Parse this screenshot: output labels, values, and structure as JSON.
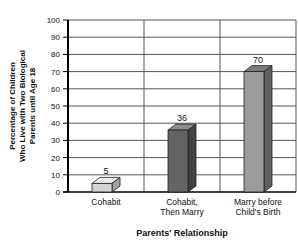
{
  "chart_data": {
    "type": "bar",
    "title": "",
    "categories": [
      "Cohabit",
      "Cohabit, Then Marry",
      "Marry before Child's Birth"
    ],
    "category_lines": [
      [
        "Cohabit"
      ],
      [
        "Cohabit,",
        "Then Marry"
      ],
      [
        "Marry before",
        "Child's Birth"
      ]
    ],
    "values": [
      5,
      36,
      70
    ],
    "value_labels": [
      "5",
      "36",
      "70"
    ],
    "xlabel": "Parents' Relationship",
    "ylabel": "Percentage of Children Who Live with Two Biological Parents until Age 18",
    "ylabel_lines": [
      "Percentage of Children",
      "Who Live with Two Biological",
      "Parents until Age 18"
    ],
    "ylim": [
      0,
      100
    ],
    "ytick_step": 10,
    "yticks": [
      0,
      10,
      20,
      30,
      40,
      50,
      60,
      70,
      80,
      90,
      100
    ],
    "grid": {
      "horizontal": true,
      "column_dividers": true,
      "right_border": true
    },
    "legend": {
      "visible": false
    },
    "bar_styles": [
      {
        "front": "#d4d4d4",
        "top": "#ebebeb",
        "side": "#a3a3a3"
      },
      {
        "front": "#646464",
        "top": "#8e8e8e",
        "side": "#424242"
      },
      {
        "front": "#9c9c9c",
        "top": "#7b7b7b",
        "side": "#606060"
      }
    ],
    "colors": {
      "axis": "#000000",
      "grid": "#555555",
      "outline": "#222222",
      "text": "#111111",
      "background": "#ffffff"
    }
  }
}
